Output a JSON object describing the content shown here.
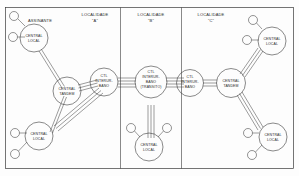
{
  "diagram": {
    "annotation": "ASSINANTE",
    "localities": [
      {
        "id": "loc-a",
        "line1": "LOCALIDADE",
        "line2": "\"A\""
      },
      {
        "id": "loc-b",
        "line1": "LOCALIDADE",
        "line2": "\"B\""
      },
      {
        "id": "loc-c",
        "line1": "LOCALIDADE",
        "line2": "\"C\""
      }
    ],
    "nodes": [
      {
        "id": "n-cl-a-top",
        "lines": [
          "CENTRAL",
          "LOCAL"
        ]
      },
      {
        "id": "n-ct-a",
        "lines": [
          "CENTRAL",
          "TANDEM"
        ]
      },
      {
        "id": "n-cl-a-bot",
        "lines": [
          "CENTRAL",
          "LOCAL"
        ]
      },
      {
        "id": "n-ctl-a",
        "lines": [
          "CTL",
          "INTERUR-",
          "BANO"
        ]
      },
      {
        "id": "n-ctl-b",
        "lines": [
          "CTL",
          "INTERUR-",
          "BANO",
          "(TRÂNSITO)"
        ]
      },
      {
        "id": "n-cl-b",
        "lines": [
          "CENTRAL",
          "LOCAL"
        ]
      },
      {
        "id": "n-ctl-c",
        "lines": [
          "CTL",
          "INTERUR-",
          "BANO"
        ]
      },
      {
        "id": "n-ct-c",
        "lines": [
          "CENTRAL",
          "TANDEM"
        ]
      },
      {
        "id": "n-cl-c-top",
        "lines": [
          "CENTRAL",
          "LOCAL"
        ]
      },
      {
        "id": "n-cl-c-bot",
        "lines": [
          "CENTRAL",
          "LOCAL"
        ]
      }
    ],
    "colors": {
      "stroke": "#3a3a3a",
      "background": "#fdfdfd",
      "text": "#2a2a2a"
    }
  }
}
